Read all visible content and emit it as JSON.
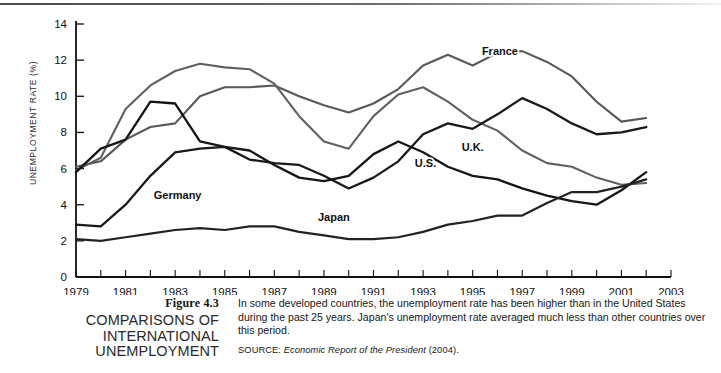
{
  "figure": {
    "number": "Figure 4.3",
    "title_lines": [
      "COMPARISONS OF",
      "INTERNATIONAL",
      "UNEMPLOYMENT"
    ],
    "body": "In some developed countries, the unemployment rate has been higher than in the United States during the past 25 years. Japan's unemployment rate averaged much less than other countries over this period.",
    "source_label": "SOURCE:",
    "source_title": "Economic Report of the President",
    "source_year": "(2004)."
  },
  "chart_data": {
    "type": "line",
    "title": "",
    "xlabel": "",
    "ylabel": "UNEMPLOYMENT RATE (%)",
    "xlim": [
      1979,
      2003
    ],
    "ylim": [
      0,
      14
    ],
    "yticks": [
      0,
      2,
      4,
      6,
      8,
      10,
      12,
      14
    ],
    "xticks": [
      1979,
      1981,
      1983,
      1985,
      1987,
      1989,
      1991,
      1993,
      1995,
      1997,
      1999,
      2001,
      2003
    ],
    "xtick_minor_step": 1,
    "grid": false,
    "legend": "inline-labels",
    "x": [
      1979,
      1980,
      1981,
      1982,
      1983,
      1984,
      1985,
      1986,
      1987,
      1988,
      1989,
      1990,
      1991,
      1992,
      1993,
      1994,
      1995,
      1996,
      1997,
      1998,
      1999,
      2000,
      2001,
      2002
    ],
    "series": [
      {
        "name": "France",
        "color": "#585858",
        "width": 2.1,
        "label_x": 1996.1,
        "label_y": 12.3,
        "values": [
          6.1,
          6.4,
          7.6,
          8.3,
          8.5,
          10.0,
          10.5,
          10.5,
          10.6,
          10.0,
          9.5,
          9.1,
          9.6,
          10.4,
          11.7,
          12.3,
          11.7,
          12.4,
          12.5,
          11.9,
          11.1,
          9.7,
          8.6,
          8.8
        ]
      },
      {
        "name": "U.K.",
        "color": "#606060",
        "width": 2.1,
        "label_x": 1995.0,
        "label_y": 7.0,
        "values": [
          5.9,
          6.6,
          9.3,
          10.6,
          11.4,
          11.8,
          11.6,
          11.5,
          10.7,
          8.9,
          7.5,
          7.1,
          8.9,
          10.1,
          10.5,
          9.7,
          8.7,
          8.1,
          7.0,
          6.3,
          6.1,
          5.5,
          5.1,
          5.2
        ]
      },
      {
        "name": "Germany",
        "color": "#191919",
        "width": 2.3,
        "label_x": 1983.1,
        "label_y": 4.3,
        "values": [
          2.9,
          2.8,
          4.0,
          5.6,
          6.9,
          7.1,
          7.2,
          6.5,
          6.3,
          6.2,
          5.6,
          4.9,
          5.5,
          6.4,
          7.9,
          8.5,
          8.2,
          9.0,
          9.9,
          9.3,
          8.5,
          7.9,
          8.0,
          8.3
        ]
      },
      {
        "name": "U.S.",
        "color": "#151515",
        "width": 2.3,
        "label_x": 1993.1,
        "label_y": 6.1,
        "values": [
          5.8,
          7.1,
          7.6,
          9.7,
          9.6,
          7.5,
          7.2,
          7.0,
          6.2,
          5.5,
          5.3,
          5.6,
          6.8,
          7.5,
          6.9,
          6.1,
          5.6,
          5.4,
          4.9,
          4.5,
          4.2,
          4.0,
          4.8,
          5.8
        ]
      },
      {
        "name": "Japan",
        "color": "#222222",
        "width": 2.2,
        "label_x": 1989.4,
        "label_y": 3.1,
        "values": [
          2.1,
          2.0,
          2.2,
          2.4,
          2.6,
          2.7,
          2.6,
          2.8,
          2.8,
          2.5,
          2.3,
          2.1,
          2.1,
          2.2,
          2.5,
          2.9,
          3.1,
          3.4,
          3.4,
          4.1,
          4.7,
          4.7,
          5.0,
          5.4
        ]
      }
    ]
  }
}
